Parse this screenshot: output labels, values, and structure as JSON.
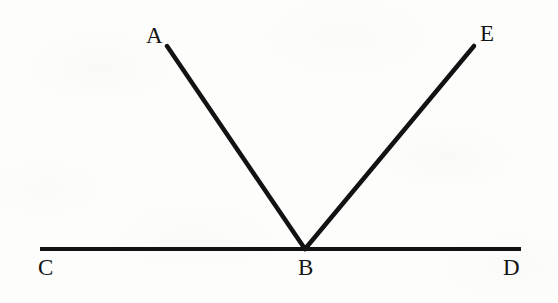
{
  "figure": {
    "background_color": "#fdfdfc",
    "stroke_color": "#121212",
    "canvas": {
      "width": 558,
      "height": 303
    }
  },
  "labels": {
    "a": "A",
    "b": "B",
    "c": "C",
    "d": "D",
    "e": "E"
  },
  "chart_data": {
    "type": "diagram",
    "points": [
      {
        "name": "A",
        "x": 167,
        "y": 46,
        "label": "A",
        "label_x": 146,
        "label_y": 24
      },
      {
        "name": "B",
        "x": 305,
        "y": 249,
        "label": "B",
        "label_x": 298,
        "label_y": 256
      },
      {
        "name": "C",
        "x": 40,
        "y": 249,
        "label": "C",
        "label_x": 38,
        "label_y": 256
      },
      {
        "name": "D",
        "x": 521,
        "y": 249,
        "label": "D",
        "label_x": 503,
        "label_y": 256
      },
      {
        "name": "E",
        "x": 474,
        "y": 46,
        "label": "E",
        "label_x": 480,
        "label_y": 22
      }
    ],
    "segments": [
      {
        "name": "CD",
        "from": "C",
        "to": "D",
        "x1": 40,
        "y1": 249,
        "x2": 521,
        "y2": 249,
        "width": 4,
        "label": "line CD"
      },
      {
        "name": "BA",
        "from": "B",
        "to": "A",
        "x1": 305,
        "y1": 249,
        "x2": 167,
        "y2": 46,
        "width": 4.5,
        "label": "ray BA"
      },
      {
        "name": "BE",
        "from": "B",
        "to": "E",
        "x1": 305,
        "y1": 249,
        "x2": 474,
        "y2": 46,
        "width": 4.5,
        "label": "ray BE"
      }
    ],
    "angles": [
      {
        "name": "ABC",
        "vertex": "B",
        "rays": [
          "BA",
          "BC"
        ],
        "degrees": 124
      },
      {
        "name": "ABE",
        "vertex": "B",
        "rays": [
          "BA",
          "BE"
        ],
        "degrees": 6
      },
      {
        "name": "EBD",
        "vertex": "B",
        "rays": [
          "BE",
          "BD"
        ],
        "degrees": 50
      }
    ],
    "xlabel": "",
    "ylabel": "",
    "grid": false,
    "legend": "none"
  }
}
